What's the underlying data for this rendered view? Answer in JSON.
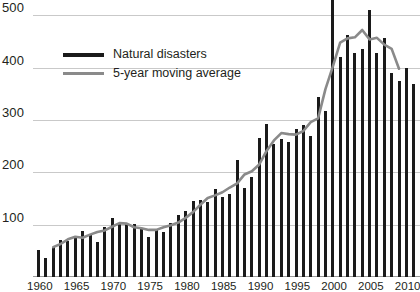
{
  "chart_data": {
    "type": "bar",
    "title": "",
    "subtitle": "",
    "xlabel": "",
    "ylabel": "",
    "ylim": [
      0,
      600
    ],
    "xlim": [
      1960,
      2011
    ],
    "grid": true,
    "legend_position": "top-left",
    "y_ticks": [
      600,
      500,
      400,
      300,
      200,
      100
    ],
    "x_ticks": [
      1960,
      1965,
      1970,
      1975,
      1980,
      1985,
      1990,
      1995,
      2000,
      2005,
      2010
    ],
    "x": [
      1960,
      1961,
      1962,
      1963,
      1964,
      1965,
      1966,
      1967,
      1968,
      1969,
      1970,
      1971,
      1972,
      1973,
      1974,
      1975,
      1976,
      1977,
      1978,
      1979,
      1980,
      1981,
      1982,
      1983,
      1984,
      1985,
      1986,
      1987,
      1988,
      1989,
      1990,
      1991,
      1992,
      1993,
      1994,
      1995,
      1996,
      1997,
      1998,
      1999,
      2000,
      2001,
      2002,
      2003,
      2004,
      2005,
      2006,
      2007,
      2008,
      2009,
      2010,
      2011
    ],
    "series": [
      {
        "name": "Natural disasters",
        "color": "#1a1a1a",
        "kind": "bar",
        "values": [
          52,
          36,
          58,
          70,
          68,
          74,
          88,
          80,
          66,
          95,
          113,
          104,
          102,
          101,
          92,
          77,
          92,
          86,
          103,
          118,
          127,
          145,
          147,
          143,
          169,
          153,
          158,
          224,
          171,
          192,
          265,
          292,
          254,
          264,
          258,
          282,
          290,
          270,
          344,
          318,
          552,
          420,
          462,
          428,
          435,
          510,
          428,
          456,
          390,
          374,
          400,
          368
        ]
      },
      {
        "name": "5-year moving average",
        "color": "#8a8a8a",
        "kind": "line",
        "values": [
          null,
          null,
          57,
          63,
          72,
          77,
          75,
          81,
          86,
          89,
          96,
          103,
          102,
          95,
          93,
          90,
          90,
          95,
          99,
          104,
          113,
          124,
          138,
          151,
          156,
          162,
          171,
          179,
          196,
          202,
          215,
          241,
          261,
          275,
          273,
          272,
          279,
          296,
          303,
          359,
          402,
          448,
          456,
          458,
          472,
          454,
          457,
          444,
          436,
          398,
          null,
          null
        ]
      }
    ],
    "legend": [
      {
        "label": "Natural disasters",
        "style": "bar"
      },
      {
        "label": "5-year moving average",
        "style": "line"
      }
    ],
    "colors": {
      "bar": "#1a1a1a",
      "moving_average": "#8a8a8a",
      "gridline": "#c9c9c9",
      "axis": "#9a9a9a",
      "text": "#231f20",
      "background": "#ffffff"
    }
  }
}
